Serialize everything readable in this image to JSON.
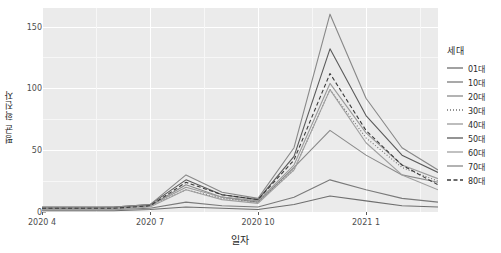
{
  "chart_data": {
    "type": "line",
    "title": "",
    "xlabel": "일자",
    "ylabel": "평균 확진자",
    "legend_title": "세대",
    "legend_position": "right",
    "grid": true,
    "ylim": [
      0,
      165
    ],
    "yticks": [
      0,
      50,
      100,
      150
    ],
    "ytick_labels": [
      "0",
      "50",
      "100",
      "150"
    ],
    "xtick_labels": [
      "2020 4",
      "2020 7",
      "2020 10",
      "2021 1"
    ],
    "xtick_values": [
      0,
      3,
      6,
      9
    ],
    "xlim": [
      0,
      11
    ],
    "x": [
      0,
      1,
      2,
      3,
      4,
      5,
      6,
      7,
      8,
      9,
      10,
      11
    ],
    "x_labels": [
      "2020 4",
      "2020 5",
      "2020 6",
      "2020 7",
      "2020 8",
      "2020 9",
      "2020 10",
      "2020 11",
      "2020 12",
      "2021 1",
      "2021 2",
      "2021 3"
    ],
    "series": [
      {
        "name": "01대",
        "linetype": "solid",
        "color": "#6e6e6e",
        "values": [
          1,
          1,
          1,
          2,
          4,
          3,
          2,
          6,
          13,
          9,
          5,
          4
        ]
      },
      {
        "name": "10대",
        "linetype": "solid",
        "color": "#7a7a7a",
        "values": [
          2,
          2,
          2,
          3,
          8,
          5,
          4,
          12,
          26,
          18,
          11,
          8
        ]
      },
      {
        "name": "20대",
        "linetype": "solid",
        "color": "#8a8a8a",
        "values": [
          3,
          3,
          3,
          5,
          22,
          12,
          8,
          36,
          66,
          46,
          30,
          24
        ]
      },
      {
        "name": "30대",
        "linetype": "dotted",
        "color": "#707070",
        "values": [
          3,
          3,
          3,
          5,
          18,
          11,
          8,
          34,
          99,
          60,
          36,
          25
        ]
      },
      {
        "name": "40대",
        "linetype": "solid",
        "color": "#9a9a9a",
        "values": [
          3,
          3,
          3,
          5,
          20,
          12,
          9,
          38,
          104,
          64,
          38,
          27
        ]
      },
      {
        "name": "50대",
        "linetype": "solid",
        "color": "#5a5a5a",
        "values": [
          4,
          4,
          4,
          6,
          26,
          14,
          10,
          45,
          132,
          78,
          46,
          32
        ]
      },
      {
        "name": "60대",
        "linetype": "solid",
        "color": "#9f9f9f",
        "values": [
          2,
          2,
          2,
          4,
          18,
          10,
          7,
          34,
          99,
          56,
          30,
          18
        ]
      },
      {
        "name": "70대",
        "linetype": "solid",
        "color": "#888888",
        "values": [
          3,
          3,
          4,
          6,
          30,
          16,
          11,
          52,
          160,
          92,
          52,
          34
        ]
      },
      {
        "name": "80대",
        "linetype": "dashed",
        "color": "#3a3a3a",
        "values": [
          3,
          3,
          3,
          5,
          24,
          14,
          10,
          42,
          112,
          66,
          38,
          22
        ]
      }
    ]
  }
}
